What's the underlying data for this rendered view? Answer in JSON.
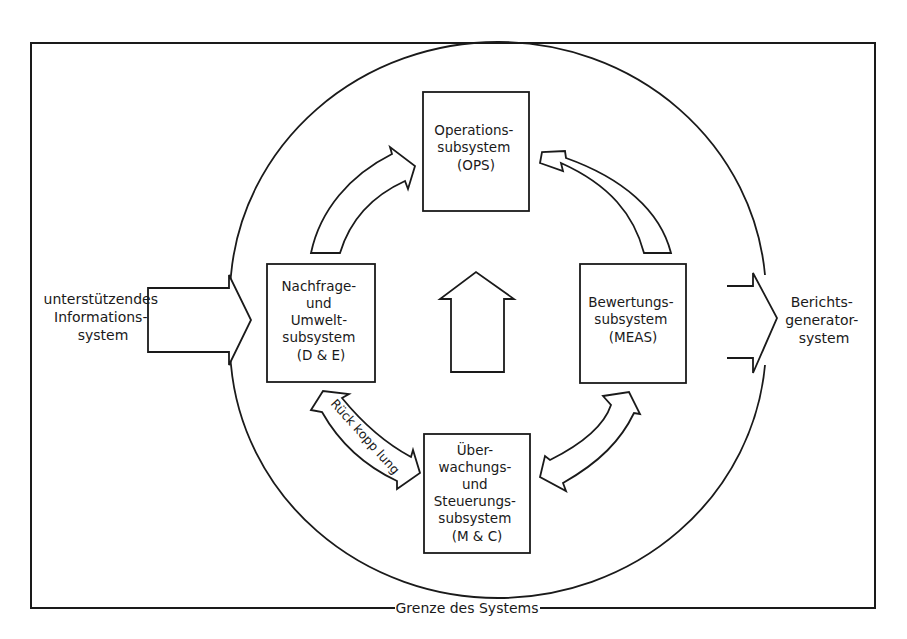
{
  "diagram": {
    "boundary_label": "Grenze des Systems",
    "input": {
      "lines": [
        "unterstützendes",
        "Informations-",
        "system"
      ]
    },
    "output": {
      "lines": [
        "Berichts-",
        "generator-",
        "system"
      ]
    },
    "subsystems": {
      "ops": {
        "lines": [
          "Operations-",
          "subsystem",
          "(OPS)"
        ]
      },
      "de": {
        "lines": [
          "Nachfrage-",
          "und",
          "Umwelt-",
          "subsystem",
          "(D & E)"
        ]
      },
      "meas": {
        "lines": [
          "Bewertungs-",
          "subsystem",
          "(MEAS)"
        ]
      },
      "mc": {
        "lines": [
          "Über-",
          "wachungs-",
          "und",
          "Steuerungs-",
          "subsystem",
          "(M & C)"
        ]
      }
    },
    "feedback_label": "Rück kopp lung",
    "colors": {
      "ink": "#1a1a1a",
      "paper": "#ffffff"
    }
  }
}
